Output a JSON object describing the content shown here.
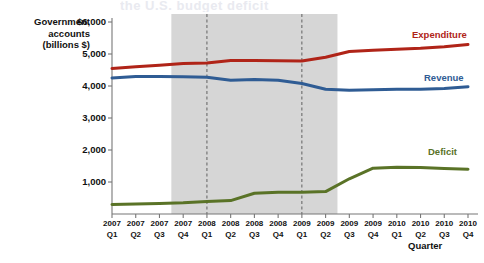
{
  "figure": {
    "bleed_text": "the U.S. budget deficit"
  },
  "chart_data": {
    "type": "line",
    "title": "",
    "xlabel": "Quarter",
    "ylabel": "Government accounts (billions $)",
    "ylabel_lines": [
      "Government",
      "accounts",
      "(billions $)"
    ],
    "grid": false,
    "legend_position": "right-inline",
    "ylim": [
      0,
      6000
    ],
    "yticks": [
      1000,
      2000,
      3000,
      4000,
      5000,
      6000
    ],
    "ytick_labels": [
      "1,000",
      "2,000",
      "3,000",
      "4,000",
      "5,000",
      "$6,000"
    ],
    "categories": [
      "2007 Q1",
      "2007 Q2",
      "2007 Q3",
      "2007 Q4",
      "2008 Q1",
      "2008 Q2",
      "2008 Q3",
      "2008 Q4",
      "2009 Q1",
      "2009 Q2",
      "2009 Q3",
      "2009 Q4",
      "2010 Q1",
      "2010 Q2",
      "2010 Q3",
      "2010 Q4"
    ],
    "xtick_years": [
      "2007",
      "2007",
      "2007",
      "2007",
      "2008",
      "2008",
      "2008",
      "2008",
      "2009",
      "2009",
      "2009",
      "2009",
      "2010",
      "2010",
      "2010",
      "2010"
    ],
    "xtick_quarters": [
      "Q1",
      "Q2",
      "Q3",
      "Q4",
      "Q1",
      "Q2",
      "Q3",
      "Q4",
      "Q1",
      "Q2",
      "Q3",
      "Q4",
      "Q1",
      "Q2",
      "Q3",
      "Q4"
    ],
    "series": [
      {
        "name": "Expenditure",
        "color": "#b02418",
        "values": [
          4550,
          4600,
          4650,
          4700,
          4720,
          4800,
          4800,
          4790,
          4780,
          4900,
          5080,
          5120,
          5150,
          5180,
          5230,
          5300
        ]
      },
      {
        "name": "Revenue",
        "color": "#2f5c94",
        "values": [
          4250,
          4300,
          4300,
          4290,
          4270,
          4180,
          4200,
          4180,
          4080,
          3900,
          3870,
          3880,
          3900,
          3900,
          3920,
          3980
        ]
      },
      {
        "name": "Deficit",
        "color": "#5a7327",
        "values": [
          300,
          310,
          330,
          350,
          390,
          420,
          650,
          680,
          680,
          700,
          1100,
          1430,
          1460,
          1450,
          1420,
          1400
        ]
      }
    ],
    "shaded_region": {
      "label": "recession",
      "start_category": "2007 Q4",
      "end_category": "2009 Q2",
      "color": "#cfcfcf"
    },
    "marker_lines": [
      {
        "category": "2008 Q1",
        "style": "dashed"
      },
      {
        "category": "2009 Q1",
        "style": "dashed"
      }
    ]
  }
}
